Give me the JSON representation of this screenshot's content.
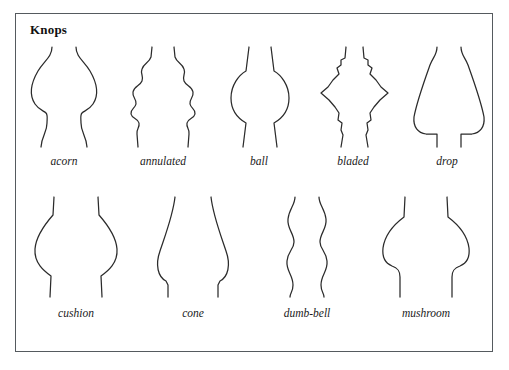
{
  "figure": {
    "title": "Knops",
    "border_color": "#555a5e",
    "ink_color": "#2b2b2b",
    "background": "#ffffff"
  },
  "rows": [
    {
      "row_index": 1,
      "items": [
        {
          "label": "acorn"
        },
        {
          "label": "annulated"
        },
        {
          "label": "ball"
        },
        {
          "label": "bladed"
        },
        {
          "label": "drop"
        }
      ]
    },
    {
      "row_index": 2,
      "items": [
        {
          "label": "cushion"
        },
        {
          "label": "cone"
        },
        {
          "label": "dumb-bell"
        },
        {
          "label": "mushroom"
        }
      ]
    }
  ]
}
